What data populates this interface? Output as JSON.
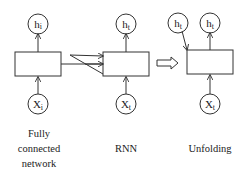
{
  "diagram": {
    "panels": [
      {
        "id": "fully-connected",
        "top_node": {
          "base": "h",
          "sub": "i"
        },
        "bottom_node": {
          "base": "X",
          "sub": "i"
        },
        "caption_lines": [
          "Fully",
          "connected",
          "network"
        ]
      },
      {
        "id": "rnn",
        "top_node": {
          "base": "h",
          "sub": "t"
        },
        "bottom_node": {
          "base": "X",
          "sub": "t"
        },
        "caption_lines": [
          "RNN"
        ]
      },
      {
        "id": "unfolding",
        "top_node": {
          "base": "h",
          "sub": "t"
        },
        "prev_state_node": {
          "base": "h",
          "sub": "t"
        },
        "bottom_node": {
          "base": "X",
          "sub": "t"
        },
        "caption_lines": [
          "Unfolding"
        ]
      }
    ],
    "connectors": {
      "recurrent_loop": "feedback arrows from fully connected box into RNN box",
      "transform_arrow": "double-line arrow from RNN to Unfolding"
    },
    "colors": {
      "stroke": "#333333",
      "background": "#ffffff"
    }
  }
}
